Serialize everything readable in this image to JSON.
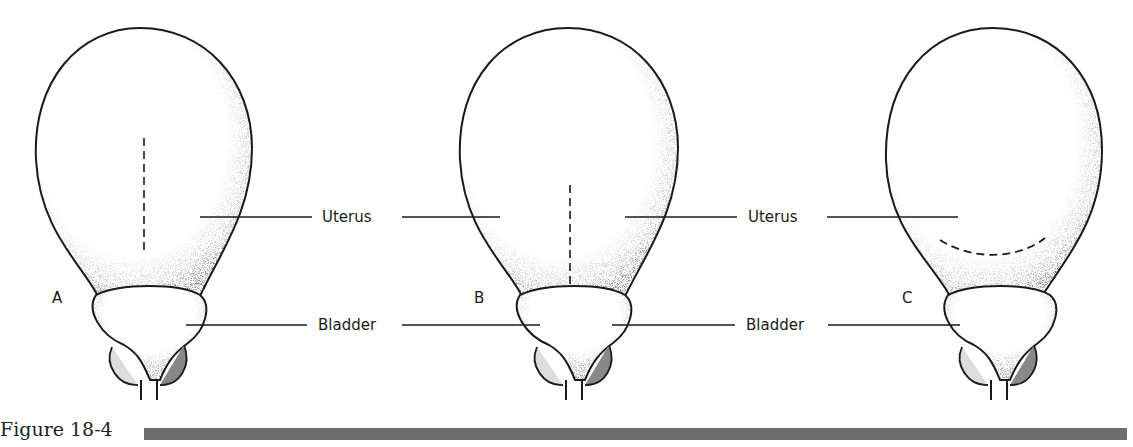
{
  "figure": {
    "caption": "Figure 18-4",
    "panels": [
      {
        "letter": "A",
        "incision": "vertical fundal (classical) incision"
      },
      {
        "letter": "B",
        "incision": "low vertical incision"
      },
      {
        "letter": "C",
        "incision": "low transverse incision"
      }
    ],
    "labels": {
      "uterus": "Uterus",
      "bladder": "Bladder"
    }
  },
  "colors": {
    "outline": "#1a1a1a",
    "shading": "#555555",
    "caption_bar": "#6e6e6e"
  }
}
